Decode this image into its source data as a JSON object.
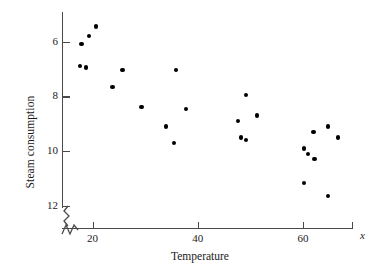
{
  "chart_data": {
    "type": "scatter",
    "title": "",
    "xlabel": "Temperature",
    "ylabel": "Steam consumption",
    "xlim": [
      12,
      67
    ],
    "ylim": [
      5.8,
      13.0
    ],
    "grid": false,
    "legend": null,
    "x_ticks": [
      20,
      40,
      60
    ],
    "y_ticks": [
      6,
      8,
      10,
      12
    ],
    "axis_break": true,
    "x_axis_symbol": "x",
    "points": [
      {
        "x": 20.7,
        "y": 12.55
      },
      {
        "x": 19.4,
        "y": 12.2
      },
      {
        "x": 17.9,
        "y": 11.9
      },
      {
        "x": 17.6,
        "y": 11.1
      },
      {
        "x": 18.8,
        "y": 11.05
      },
      {
        "x": 25.7,
        "y": 10.95
      },
      {
        "x": 35.9,
        "y": 10.95
      },
      {
        "x": 23.8,
        "y": 10.35
      },
      {
        "x": 49.2,
        "y": 10.05
      },
      {
        "x": 29.3,
        "y": 9.6
      },
      {
        "x": 37.7,
        "y": 9.55
      },
      {
        "x": 51.2,
        "y": 9.3
      },
      {
        "x": 47.7,
        "y": 9.1
      },
      {
        "x": 34.0,
        "y": 8.9
      },
      {
        "x": 62.0,
        "y": 8.7
      },
      {
        "x": 64.8,
        "y": 8.9
      },
      {
        "x": 66.6,
        "y": 8.5
      },
      {
        "x": 48.2,
        "y": 8.5
      },
      {
        "x": 49.2,
        "y": 8.4
      },
      {
        "x": 35.5,
        "y": 8.3
      },
      {
        "x": 60.2,
        "y": 8.1
      },
      {
        "x": 60.9,
        "y": 7.9
      },
      {
        "x": 62.2,
        "y": 7.7
      },
      {
        "x": 60.2,
        "y": 6.85
      },
      {
        "x": 64.8,
        "y": 6.35
      }
    ]
  },
  "axis": {
    "y_tick_labels": [
      "12",
      "10",
      "8",
      "6"
    ],
    "x_tick_labels": [
      "20",
      "40",
      "60"
    ]
  },
  "colors": {
    "point": "#000000",
    "axis": "#4a4a4a",
    "background": "#ffffff"
  }
}
